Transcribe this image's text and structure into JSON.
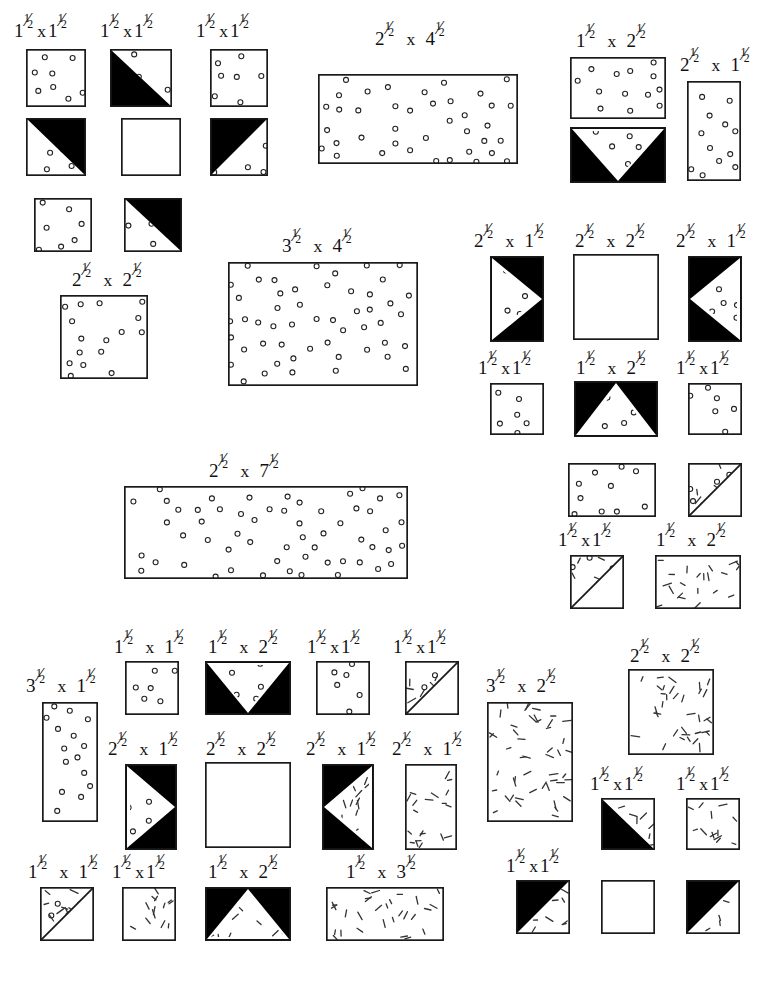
{
  "document": {
    "kind": "quilt-cutting-diagram",
    "title": "",
    "background_color": "#ffffff",
    "ink_color": "#000000",
    "fabric_styles": {
      "dot_print": "small open circles scattered on white",
      "dash_print": "short slanted dashes scattered on white",
      "solid_black": "solid black",
      "plain_white": "plain white"
    }
  },
  "label_parts": {
    "times": "x",
    "one_half": "1/2"
  },
  "pieces": [
    {
      "id": "p01",
      "label": "1½x1½",
      "w_in": "1½",
      "h_in": "1½",
      "fill": "dots",
      "x": 26,
      "y": 49,
      "w": 60,
      "h": 58,
      "label_x": 14,
      "label_y": 18
    },
    {
      "id": "p02",
      "label": "1½x1½",
      "w_in": "1½",
      "h_in": "1½",
      "fill": "hst-dots-bl",
      "x": 110,
      "y": 49,
      "w": 62,
      "h": 58,
      "label_x": 100,
      "label_y": 18
    },
    {
      "id": "p03",
      "label": "1½x1½",
      "w_in": "1½",
      "h_in": "1½",
      "fill": "dots",
      "x": 210,
      "y": 49,
      "w": 58,
      "h": 58,
      "label_x": 196,
      "label_y": 18
    },
    {
      "id": "p04",
      "label": "",
      "w_in": "1½",
      "h_in": "1½",
      "fill": "hst-dots-tr",
      "x": 26,
      "y": 118,
      "w": 60,
      "h": 58,
      "label_x": 0,
      "label_y": 0
    },
    {
      "id": "p05",
      "label": "",
      "w_in": "1½",
      "h_in": "1½",
      "fill": "white",
      "x": 121,
      "y": 118,
      "w": 60,
      "h": 58,
      "label_x": 0,
      "label_y": 0
    },
    {
      "id": "p06",
      "label": "",
      "w_in": "1½",
      "h_in": "1½",
      "fill": "hst-dots-br",
      "x": 210,
      "y": 118,
      "w": 58,
      "h": 58,
      "label_x": 0,
      "label_y": 0
    },
    {
      "id": "p07",
      "label": "",
      "w_in": "1½",
      "h_in": "1½",
      "fill": "dots",
      "x": 34,
      "y": 198,
      "w": 58,
      "h": 54,
      "label_x": 0,
      "label_y": 0
    },
    {
      "id": "p08",
      "label": "",
      "w_in": "1½",
      "h_in": "1½",
      "fill": "hst-dots-bl2",
      "x": 124,
      "y": 198,
      "w": 58,
      "h": 54,
      "label_x": 0,
      "label_y": 0
    },
    {
      "id": "p09",
      "label": "2½ x 2½",
      "w_in": "2½",
      "h_in": "2½",
      "fill": "dots",
      "x": 60,
      "y": 295,
      "w": 88,
      "h": 84,
      "label_x": 72,
      "label_y": 267
    },
    {
      "id": "p10",
      "label": "2½ x 4½",
      "w_in": "2½",
      "h_in": "4½",
      "fill": "dots",
      "x": 318,
      "y": 74,
      "w": 200,
      "h": 90,
      "label_x": 375,
      "label_y": 26
    },
    {
      "id": "p11",
      "label": "3½ x 4½",
      "w_in": "3½",
      "h_in": "4½",
      "fill": "dots",
      "x": 228,
      "y": 262,
      "w": 190,
      "h": 124,
      "label_x": 282,
      "label_y": 233
    },
    {
      "id": "p12",
      "label": "2½ x 7½",
      "w_in": "2½",
      "h_in": "7½",
      "fill": "dots",
      "x": 124,
      "y": 486,
      "w": 284,
      "h": 93,
      "label_x": 209,
      "label_y": 458
    },
    {
      "id": "p13",
      "label": "1½ x 2½",
      "w_in": "1½",
      "h_in": "2½",
      "fill": "dots",
      "x": 570,
      "y": 57,
      "w": 96,
      "h": 62,
      "label_x": 576,
      "label_y": 28
    },
    {
      "id": "p14",
      "label": "",
      "w_in": "1½",
      "h_in": "2½",
      "fill": "geese-down-dots",
      "x": 570,
      "y": 127,
      "w": 96,
      "h": 56,
      "label_x": 0,
      "label_y": 0
    },
    {
      "id": "p15",
      "label": "2½ x 1½",
      "w_in": "2½",
      "h_in": "1½",
      "fill": "dots",
      "x": 687,
      "y": 81,
      "w": 54,
      "h": 100,
      "label_x": 680,
      "label_y": 52
    },
    {
      "id": "p16",
      "label": "2½ x 1½",
      "w_in": "2½",
      "h_in": "1½",
      "fill": "chev-right-dots",
      "x": 490,
      "y": 256,
      "w": 54,
      "h": 86,
      "label_x": 474,
      "label_y": 228
    },
    {
      "id": "p17",
      "label": "2½ x 2½",
      "w_in": "2½",
      "h_in": "2½",
      "fill": "white",
      "x": 573,
      "y": 254,
      "w": 86,
      "h": 86,
      "label_x": 575,
      "label_y": 228
    },
    {
      "id": "p18",
      "label": "2½ x 1½",
      "w_in": "2½",
      "h_in": "1½",
      "fill": "chev-left-dots",
      "x": 688,
      "y": 256,
      "w": 54,
      "h": 86,
      "label_x": 676,
      "label_y": 228
    },
    {
      "id": "p19",
      "label": "1½x1½",
      "w_in": "1½",
      "h_in": "1½",
      "fill": "dots",
      "x": 490,
      "y": 383,
      "w": 54,
      "h": 52,
      "label_x": 478,
      "label_y": 355
    },
    {
      "id": "p20",
      "label": "1½ x 2½",
      "w_in": "1½",
      "h_in": "2½",
      "fill": "geese-up-dots",
      "x": 574,
      "y": 381,
      "w": 84,
      "h": 56,
      "label_x": 576,
      "label_y": 355
    },
    {
      "id": "p21",
      "label": "1½x1½",
      "w_in": "1½",
      "h_in": "1½",
      "fill": "dots",
      "x": 688,
      "y": 383,
      "w": 54,
      "h": 52,
      "label_x": 676,
      "label_y": 355
    },
    {
      "id": "p22",
      "label": "",
      "w_in": "1½",
      "h_in": "2½",
      "fill": "dots",
      "x": 568,
      "y": 463,
      "w": 88,
      "h": 54,
      "label_x": 0,
      "label_y": 0
    },
    {
      "id": "p23",
      "label": "",
      "w_in": "1½",
      "h_in": "1½",
      "fill": "diag-dots-dash",
      "x": 688,
      "y": 463,
      "w": 54,
      "h": 54,
      "label_x": 0,
      "label_y": 0
    },
    {
      "id": "p24",
      "label": "1½x1½",
      "w_in": "1½",
      "h_in": "1½",
      "fill": "diag-dots-dash",
      "x": 570,
      "y": 555,
      "w": 54,
      "h": 54,
      "label_x": 558,
      "label_y": 527
    },
    {
      "id": "p25",
      "label": "1½ x 2½",
      "w_in": "1½",
      "h_in": "2½",
      "fill": "dashes",
      "x": 655,
      "y": 555,
      "w": 86,
      "h": 54,
      "label_x": 656,
      "label_y": 527
    },
    {
      "id": "p26",
      "label": "3½ x 1½",
      "w_in": "3½",
      "h_in": "1½",
      "fill": "dots",
      "x": 42,
      "y": 702,
      "w": 56,
      "h": 120,
      "label_x": 26,
      "label_y": 673
    },
    {
      "id": "p27",
      "label": "1½ x 1½",
      "w_in": "1½",
      "h_in": "1½",
      "fill": "dots",
      "x": 125,
      "y": 661,
      "w": 54,
      "h": 54,
      "label_x": 114,
      "label_y": 634
    },
    {
      "id": "p28",
      "label": "1½ x 2½",
      "w_in": "1½",
      "h_in": "2½",
      "fill": "geese-down-dots",
      "x": 205,
      "y": 661,
      "w": 86,
      "h": 54,
      "label_x": 208,
      "label_y": 634
    },
    {
      "id": "p29",
      "label": "1½x1½",
      "w_in": "1½",
      "h_in": "1½",
      "fill": "dots",
      "x": 316,
      "y": 661,
      "w": 54,
      "h": 54,
      "label_x": 307,
      "label_y": 634
    },
    {
      "id": "p30",
      "label": "1½x1½",
      "w_in": "1½",
      "h_in": "1½",
      "fill": "diag-dots-dash",
      "x": 405,
      "y": 661,
      "w": 54,
      "h": 54,
      "label_x": 393,
      "label_y": 634
    },
    {
      "id": "p31",
      "label": "2½ x 1½",
      "w_in": "2½",
      "h_in": "1½",
      "fill": "chev-right-dots",
      "x": 125,
      "y": 764,
      "w": 52,
      "h": 86,
      "label_x": 108,
      "label_y": 736
    },
    {
      "id": "p32",
      "label": "2½ x 2½",
      "w_in": "2½",
      "h_in": "2½",
      "fill": "white",
      "x": 205,
      "y": 762,
      "w": 86,
      "h": 86,
      "label_x": 206,
      "label_y": 736
    },
    {
      "id": "p33",
      "label": "2½ x 1½",
      "w_in": "2½",
      "h_in": "1½",
      "fill": "chev-left-dash",
      "x": 322,
      "y": 764,
      "w": 52,
      "h": 86,
      "label_x": 306,
      "label_y": 736
    },
    {
      "id": "p34",
      "label": "2½ x 1½",
      "w_in": "2½",
      "h_in": "1½",
      "fill": "dashes",
      "x": 405,
      "y": 764,
      "w": 52,
      "h": 86,
      "label_x": 392,
      "label_y": 736
    },
    {
      "id": "p35",
      "label": "1½ x 1½",
      "w_in": "1½",
      "h_in": "1½",
      "fill": "diag-dots-dash",
      "x": 40,
      "y": 887,
      "w": 54,
      "h": 54,
      "label_x": 28,
      "label_y": 859
    },
    {
      "id": "p36",
      "label": "1½x1½",
      "w_in": "1½",
      "h_in": "1½",
      "fill": "dashes",
      "x": 122,
      "y": 887,
      "w": 54,
      "h": 54,
      "label_x": 112,
      "label_y": 859
    },
    {
      "id": "p37",
      "label": "1½ x 2½",
      "w_in": "1½",
      "h_in": "2½",
      "fill": "geese-up-dash",
      "x": 205,
      "y": 887,
      "w": 86,
      "h": 54,
      "label_x": 208,
      "label_y": 859
    },
    {
      "id": "p38",
      "label": "1½ x 3½",
      "w_in": "1½",
      "h_in": "3½",
      "fill": "dashes",
      "x": 326,
      "y": 887,
      "w": 118,
      "h": 54,
      "label_x": 346,
      "label_y": 859
    },
    {
      "id": "p39",
      "label": "3½ x 2½",
      "w_in": "3½",
      "h_in": "2½",
      "fill": "dashes",
      "x": 487,
      "y": 702,
      "w": 86,
      "h": 120,
      "label_x": 486,
      "label_y": 673
    },
    {
      "id": "p40",
      "label": "2½ x 2½",
      "w_in": "2½",
      "h_in": "2½",
      "fill": "dashes",
      "x": 628,
      "y": 669,
      "w": 86,
      "h": 86,
      "label_x": 630,
      "label_y": 643
    },
    {
      "id": "p41",
      "label": "1½x1½",
      "w_in": "1½",
      "h_in": "1½",
      "fill": "hst-dash-bl",
      "x": 601,
      "y": 798,
      "w": 54,
      "h": 52,
      "label_x": 590,
      "label_y": 771
    },
    {
      "id": "p42",
      "label": "1½x1½",
      "w_in": "1½",
      "h_in": "1½",
      "fill": "dashes",
      "x": 686,
      "y": 798,
      "w": 54,
      "h": 52,
      "label_x": 676,
      "label_y": 771
    },
    {
      "id": "p43",
      "label": "1½x1½",
      "w_in": "1½",
      "h_in": "1½",
      "fill": "hst-dash-tl",
      "x": 516,
      "y": 880,
      "w": 54,
      "h": 54,
      "label_x": 506,
      "label_y": 853
    },
    {
      "id": "p44",
      "label": "",
      "w_in": "1½",
      "h_in": "1½",
      "fill": "white",
      "x": 601,
      "y": 880,
      "w": 54,
      "h": 54,
      "label_x": 0,
      "label_y": 0
    },
    {
      "id": "p45",
      "label": "",
      "w_in": "1½",
      "h_in": "1½",
      "fill": "hst-dash-tl",
      "x": 686,
      "y": 880,
      "w": 54,
      "h": 54,
      "label_x": 0,
      "label_y": 0
    }
  ]
}
